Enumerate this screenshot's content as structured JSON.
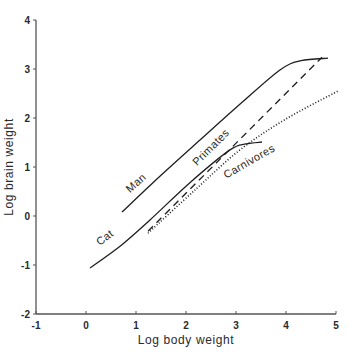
{
  "chart_data": {
    "type": "line",
    "title": "",
    "xlabel": "Log body weight",
    "ylabel": "Log brain weight",
    "xlim": [
      -1,
      5
    ],
    "ylim": [
      -2,
      4
    ],
    "xticks": [
      -1,
      0,
      1,
      2,
      3,
      4,
      5
    ],
    "yticks": [
      -2,
      -1,
      0,
      1,
      2,
      3,
      4
    ],
    "grid": false,
    "legend": "none (curves labeled inline)",
    "series": [
      {
        "name": "Man",
        "style": "solid",
        "points": [
          [
            0.72,
            0.08
          ],
          [
            1.5,
            0.83
          ],
          [
            2.28,
            1.55
          ],
          [
            3.1,
            2.3
          ],
          [
            3.88,
            2.98
          ],
          [
            4.3,
            3.17
          ],
          [
            4.84,
            3.22
          ]
        ],
        "label": {
          "text": "Man",
          "x": 1.05,
          "y": 0.62,
          "rotate": -42
        }
      },
      {
        "name": "Cat",
        "style": "solid",
        "points": [
          [
            0.08,
            -1.06
          ],
          [
            0.7,
            -0.6
          ],
          [
            1.28,
            -0.08
          ],
          [
            2.1,
            0.7
          ],
          [
            2.88,
            1.35
          ],
          [
            3.2,
            1.47
          ],
          [
            3.52,
            1.51
          ]
        ],
        "label": {
          "text": "Cat",
          "x": 0.42,
          "y": -0.5,
          "rotate": -37
        }
      },
      {
        "name": "Primates",
        "style": "dashed",
        "points": [
          [
            1.24,
            -0.31
          ],
          [
            4.72,
            3.24
          ]
        ],
        "label": {
          "text": "Primates",
          "x": 2.55,
          "y": 1.35,
          "rotate": -45
        }
      },
      {
        "name": "Carnivores",
        "style": "dotted",
        "points": [
          [
            1.24,
            -0.35
          ],
          [
            2.2,
            0.55
          ],
          [
            3.08,
            1.35
          ],
          [
            4.0,
            1.98
          ],
          [
            5.04,
            2.55
          ]
        ],
        "label": {
          "text": "Carnivores",
          "x": 3.3,
          "y": 1.05,
          "rotate": -30
        }
      }
    ]
  },
  "colors": {
    "axis": "#555555",
    "line": "#1e1e1e",
    "text": "#2a2a2a",
    "background": "#ffffff"
  }
}
